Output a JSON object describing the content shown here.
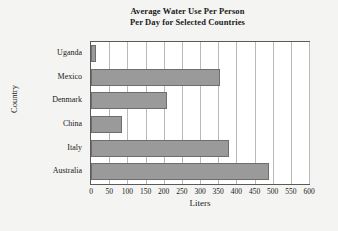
{
  "chart_data": {
    "type": "bar",
    "orientation": "horizontal",
    "title": "Average Water Use Per Person Per Day for Selected Countries",
    "title_lines": [
      "Average Water Use Per Person",
      "Per Day for Selected Countries"
    ],
    "categories": [
      "Uganda",
      "Mexico",
      "Denmark",
      "China",
      "Italy",
      "Australia"
    ],
    "values": [
      15,
      355,
      210,
      85,
      380,
      490
    ],
    "xlabel": "Liters",
    "ylabel": "Country",
    "xlim": [
      0,
      600
    ],
    "xticks": [
      0,
      50,
      100,
      150,
      200,
      250,
      300,
      350,
      400,
      450,
      500,
      550,
      600
    ],
    "xtick_labels": [
      "0",
      "50",
      "100",
      "150",
      "200",
      "250",
      "300",
      "350",
      "400",
      "450",
      "500",
      "550",
      "600"
    ],
    "grid": true,
    "grid_axis": "x",
    "legend": null,
    "bar_color": "#9a9a9a",
    "bar_edge_color": "#6e6e6e",
    "plot_background": "#ffffff",
    "figure_background": "#f4f4f2",
    "frame_color": "#5a5a5a",
    "gridline_color": "#b9b9b9"
  }
}
